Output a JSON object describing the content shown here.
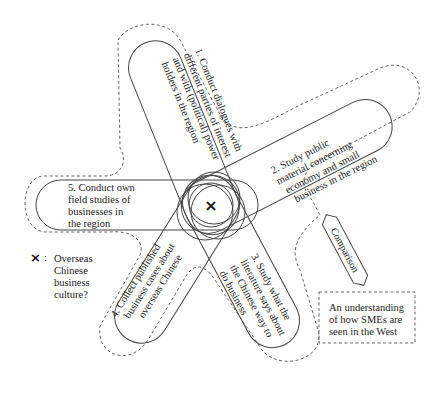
{
  "petals": [
    {
      "id": 1,
      "lines": [
        "1. Conduct dialogues with",
        "different parties of interest",
        "and with (political) power",
        "holders in the region"
      ]
    },
    {
      "id": 2,
      "lines": [
        "2. Study public",
        "material concerning",
        "economy and small",
        "business in the region"
      ]
    },
    {
      "id": 3,
      "lines": [
        "3. Study what the",
        "literature says about",
        "the Chinese way to",
        "do business"
      ]
    },
    {
      "id": 4,
      "lines": [
        "4. Collect published",
        "business cases about",
        "overseas Chinese"
      ]
    },
    {
      "id": 5,
      "lines": [
        "5. Conduct own",
        "field studies of",
        "businesses in",
        "the region"
      ]
    }
  ],
  "center_marker": "×",
  "legend": {
    "symbol": "×",
    "separator": ":",
    "lines": [
      "Overseas",
      "Chinese",
      "business",
      "culture?"
    ]
  },
  "comparison_arrow": {
    "label": "Comparison"
  },
  "west_box": {
    "lines": [
      "An understanding",
      "of how SMEs are",
      "seen in the West"
    ]
  },
  "colors": {
    "stroke": "#444444",
    "text": "#222222",
    "background": "#ffffff"
  }
}
